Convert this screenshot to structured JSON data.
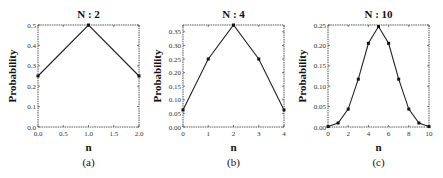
{
  "chart_data": [
    {
      "type": "line",
      "title": "N : 2",
      "caption": "(a)",
      "xlabel": "n",
      "ylabel": "Probability",
      "x": [
        0,
        1,
        2
      ],
      "series": [
        {
          "name": "N=2",
          "values": [
            0.25,
            0.5,
            0.25
          ]
        }
      ],
      "xlim": [
        0,
        2
      ],
      "ylim": [
        0,
        0.5
      ],
      "xticks": [
        0,
        0.5,
        1,
        1.5,
        2
      ],
      "xtick_labels": [
        "0.0",
        "0.5",
        "1.0",
        "1.5",
        "2.0"
      ],
      "yticks": [
        0,
        0.1,
        0.2,
        0.3,
        0.4,
        0.5
      ],
      "ytick_labels": [
        "0.0",
        "0.1",
        "0.2",
        "0.3",
        "0.4",
        "0.5"
      ],
      "grid": false,
      "markers": true
    },
    {
      "type": "line",
      "title": "N : 4",
      "caption": "(b)",
      "xlabel": "n",
      "ylabel": "Probability",
      "x": [
        0,
        1,
        2,
        3,
        4
      ],
      "series": [
        {
          "name": "N=4",
          "values": [
            0.0625,
            0.25,
            0.375,
            0.25,
            0.0625
          ]
        }
      ],
      "xlim": [
        0,
        4
      ],
      "ylim": [
        0,
        0.375
      ],
      "xticks": [
        0,
        1,
        2,
        3,
        4
      ],
      "xtick_labels": [
        "0",
        "1",
        "2",
        "3",
        "4"
      ],
      "yticks": [
        0,
        0.05,
        0.1,
        0.15,
        0.2,
        0.25,
        0.3,
        0.35
      ],
      "ytick_labels": [
        "0.00",
        "0.05",
        "0.10",
        "0.15",
        "0.20",
        "0.25",
        "0.30",
        "0.35"
      ],
      "grid": false,
      "markers": true
    },
    {
      "type": "line",
      "title": "N : 10",
      "caption": "(c)",
      "xlabel": "n",
      "ylabel": "Probability",
      "x": [
        0,
        1,
        2,
        3,
        4,
        5,
        6,
        7,
        8,
        9,
        10
      ],
      "series": [
        {
          "name": "N=10",
          "values": [
            0.001,
            0.0098,
            0.0439,
            0.1172,
            0.2051,
            0.2461,
            0.2051,
            0.1172,
            0.0439,
            0.0098,
            0.001
          ]
        }
      ],
      "xlim": [
        0,
        10
      ],
      "ylim": [
        0,
        0.25
      ],
      "xticks": [
        0,
        2,
        4,
        6,
        8,
        10
      ],
      "xtick_labels": [
        "0",
        "2",
        "4",
        "6",
        "8",
        "10"
      ],
      "yticks": [
        0,
        0.05,
        0.1,
        0.15,
        0.2,
        0.25
      ],
      "ytick_labels": [
        "0.00",
        "0.05",
        "0.10",
        "0.15",
        "0.20",
        "0.25"
      ],
      "grid": false,
      "markers": true
    }
  ],
  "layout": {
    "frames": [
      {
        "left": 38,
        "top": 25,
        "right": 139,
        "bottom": 127
      },
      {
        "left": 183,
        "top": 25,
        "right": 284,
        "bottom": 127
      },
      {
        "left": 328,
        "top": 25,
        "right": 429,
        "bottom": 127
      }
    ]
  }
}
